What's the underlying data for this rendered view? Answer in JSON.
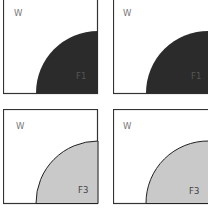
{
  "panels": [
    {
      "id": "top-left",
      "region_label": "W",
      "phase_label": "F1",
      "fill": "#2b2b2b",
      "label_color": "#555555"
    },
    {
      "id": "top-right",
      "region_label": "W",
      "phase_label": "F1",
      "fill": "#2b2b2b",
      "label_color": "#555555"
    },
    {
      "id": "bottom-left",
      "region_label": "W",
      "phase_label": "F3",
      "fill": "#c9c9c9",
      "label_color": "#444444"
    },
    {
      "id": "bottom-right",
      "region_label": "W",
      "phase_label": "F3",
      "fill": "#c9c9c9",
      "label_color": "#444444"
    }
  ],
  "colors": {
    "border": "#333333",
    "background": "#ffffff"
  }
}
